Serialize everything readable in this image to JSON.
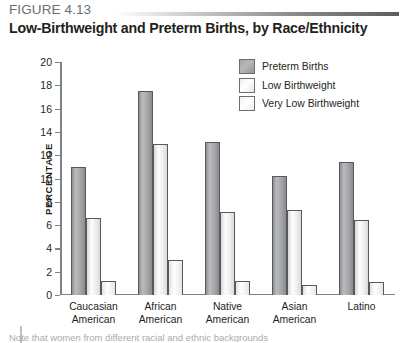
{
  "figure": {
    "label": "FIGURE 4.13",
    "title": "Low-Birthweight and Preterm Births, by Race/Ethnicity",
    "caption": "Note that women from different racial and ethnic backgrounds"
  },
  "chart_data": {
    "type": "bar",
    "title": "Low-Birthweight and Preterm Births, by Race/Ethnicity",
    "xlabel": "",
    "ylabel": "PERCENTAGE",
    "ylim": [
      0,
      20
    ],
    "ytick_step": 2,
    "yticks": [
      "20",
      "18",
      "16",
      "14",
      "12",
      "10",
      "8",
      "6",
      "4",
      "2",
      "0"
    ],
    "grid": false,
    "legend_position": "top-right",
    "categories": [
      "Caucasian American",
      "African American",
      "Native American",
      "Asian American",
      "Latino"
    ],
    "category_lines": [
      [
        "Caucasian",
        "American"
      ],
      [
        "African",
        "American"
      ],
      [
        "Native",
        "American"
      ],
      [
        "Asian",
        "American"
      ],
      [
        "Latino",
        ""
      ]
    ],
    "series": [
      {
        "name": "Preterm Births",
        "color": "#a6a8ab",
        "values": [
          11.0,
          17.5,
          13.1,
          10.2,
          11.4
        ]
      },
      {
        "name": "Low Birthweight",
        "color": "#f1f2f2",
        "values": [
          6.6,
          13.0,
          7.1,
          7.3,
          6.4
        ]
      },
      {
        "name": "Very Low Birthweight",
        "color": "#f7f7f8",
        "values": [
          1.2,
          3.0,
          1.2,
          0.9,
          1.1
        ]
      }
    ]
  }
}
